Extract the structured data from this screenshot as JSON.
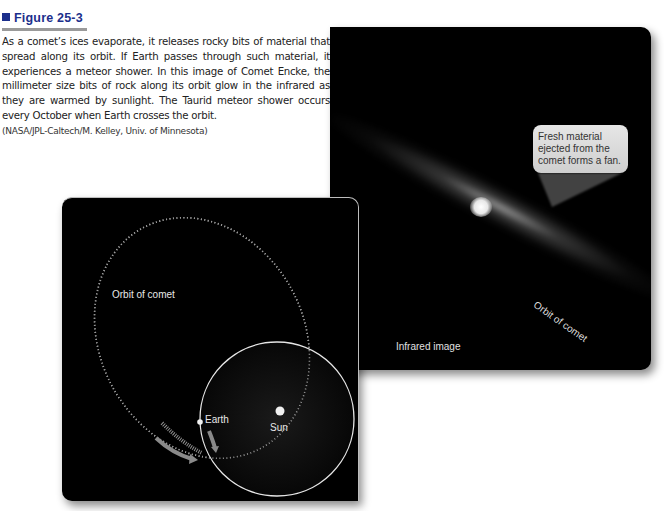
{
  "figure": {
    "number_label": "Figure 25-3",
    "caption": "As a comet’s ices evaporate, it releases rocky bits of material that spread along its orbit. If Earth passes through such material, it experiences a meteor shower. In this image of Comet Encke, the millimeter size bits of rock along its orbit glow in the infrared as they are warmed by sunlight. The Taurid meteor shower occurs every October when Earth crosses the orbit.",
    "credit": "(NASA/JPL-Caltech/M. Kelley, Univ. of Minnesota)",
    "heading_color": "#1c2f8c"
  },
  "infrared_panel": {
    "callout_text": "Fresh material ejected from the comet forms a fan.",
    "orbit_label": "Orbit of comet",
    "panel_label": "Infrared image"
  },
  "orbit_diagram": {
    "orbit_label": "Orbit of comet",
    "earth_label": "Earth",
    "sun_label": "Sun",
    "arrow_color": "#8a8a8a"
  }
}
